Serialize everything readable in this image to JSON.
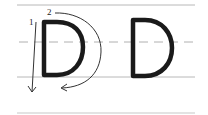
{
  "diagram": {
    "type": "letter-formation-guide",
    "letter": "D",
    "guide_lines": {
      "top": {
        "y": 5,
        "style": "solid",
        "color": "#b8b8b8"
      },
      "midline": {
        "y": 42,
        "style": "dashed",
        "color": "#b0b0b0"
      },
      "baseline": {
        "y": 77,
        "style": "solid",
        "color": "#b8b8b8"
      },
      "bottom": {
        "y": 113,
        "style": "solid",
        "color": "#c8c8c8"
      },
      "x_start": 17,
      "x_end": 195
    },
    "strokes": [
      {
        "number": "1",
        "description": "straight line down"
      },
      {
        "number": "2",
        "description": "curve around to the bottom"
      }
    ],
    "ink_color": "#1a1a1a",
    "arrow_color": "#333333"
  }
}
